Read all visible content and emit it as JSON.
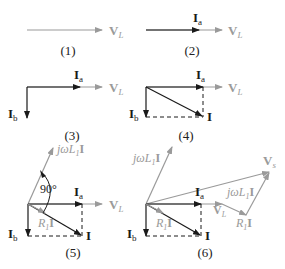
{
  "colors": {
    "dark": "#1a1a1a",
    "gray": "#9a9a9a"
  },
  "captions": [
    "(1)",
    "(2)",
    "(3)",
    "(4)",
    "(5)",
    "(6)"
  ],
  "labels": {
    "VL": "V",
    "VL_sub": "L",
    "Ia": "I",
    "Ia_sub": "a",
    "Ib": "I",
    "Ib_sub": "b",
    "I": "I",
    "Vs": "V",
    "Vs_sub": "s",
    "jwL1I_pre": "jωL",
    "jwL1I_sub": "1",
    "jwL1I_post": "I",
    "R1I_pre": "R",
    "R1I_sub": "1",
    "R1I_post": "I",
    "angle": "90°"
  },
  "diagrams": [
    {
      "id": 1,
      "caption": "(1)",
      "vectors": [
        "V_L"
      ]
    },
    {
      "id": 2,
      "caption": "(2)",
      "vectors": [
        "I_a",
        "V_L"
      ]
    },
    {
      "id": 3,
      "caption": "(3)",
      "vectors": [
        "I_a",
        "V_L",
        "I_b"
      ]
    },
    {
      "id": 4,
      "caption": "(4)",
      "vectors": [
        "I_a",
        "V_L",
        "I_b",
        "I"
      ]
    },
    {
      "id": 5,
      "caption": "(5)",
      "vectors": [
        "I_a",
        "V_L",
        "I_b",
        "I",
        "jωL_1 I",
        "R_1 I"
      ],
      "angle": "90°"
    },
    {
      "id": 6,
      "caption": "(6)",
      "vectors": [
        "I_a",
        "V_L",
        "I_b",
        "I",
        "jωL_1 I",
        "R_1 I",
        "V_s"
      ]
    }
  ]
}
